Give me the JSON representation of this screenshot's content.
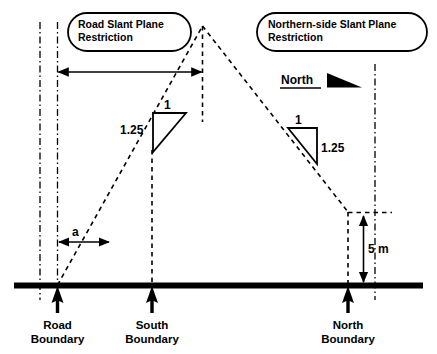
{
  "diagram": {
    "colors": {
      "ink": "#000000",
      "background": "#ffffff"
    },
    "callouts": [
      {
        "id": "road-slant-plane",
        "line1": "Road Slant Plane",
        "line2": "Restriction"
      },
      {
        "id": "northern-side-slant-plane",
        "line1": "Northern-side Slant Plane",
        "line2": "Restriction"
      }
    ],
    "compass": {
      "label": "North",
      "icon": "north-arrow-icon"
    },
    "slope_triangles": [
      {
        "id": "road-slope",
        "rise": "1",
        "run": "1.25",
        "rise_position": "top",
        "run_position": "left"
      },
      {
        "id": "northern-slope",
        "rise": "1",
        "run": "1.25",
        "rise_position": "top",
        "run_position": "right"
      }
    ],
    "dimensions": [
      {
        "id": "setback-a",
        "label": "a",
        "orientation": "horizontal"
      },
      {
        "id": "height-5m",
        "label": "5 m",
        "orientation": "vertical"
      },
      {
        "id": "road-slant-extent",
        "label": "",
        "orientation": "horizontal"
      }
    ],
    "boundaries": [
      {
        "id": "road-boundary",
        "line1": "Road",
        "line2": "Boundary"
      },
      {
        "id": "south-boundary",
        "line1": "South",
        "line2": "Boundary"
      },
      {
        "id": "north-boundary",
        "line1": "North",
        "line2": "Boundary"
      }
    ]
  }
}
